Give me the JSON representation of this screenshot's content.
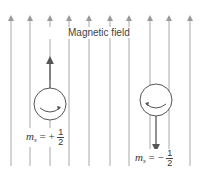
{
  "diagram": {
    "field_label": "Magnetic field",
    "field_line_color": "#a8a8a8",
    "field_line_x": [
      11,
      30,
      50,
      69,
      89,
      110,
      129,
      150,
      169,
      190
    ],
    "electrons": [
      {
        "name": "spin-up",
        "ms_symbol": "m",
        "ms_sub": "s",
        "sign": "= +",
        "numerator": "1",
        "denominator": "2",
        "spin_direction": "up"
      },
      {
        "name": "spin-down",
        "ms_symbol": "m",
        "ms_sub": "s",
        "sign": "= −",
        "numerator": "1",
        "denominator": "2",
        "spin_direction": "down"
      }
    ]
  }
}
